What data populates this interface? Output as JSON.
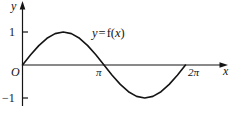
{
  "figure": {
    "background_color": "#ffffff",
    "ink_color": "#141414",
    "width": 231,
    "height": 114
  },
  "axes": {
    "x_axis_label": "x",
    "y_axis_label": "y",
    "origin_label": "O",
    "x_axis_pixel_y": 65,
    "y_axis_pixel_x": 22.5,
    "x_arrow": "arrow-right",
    "y_arrow": "arrow-up"
  },
  "ticks": {
    "y": [
      {
        "label": "1",
        "value": 1,
        "pixel_y": 32
      },
      {
        "label": "−1",
        "value": -1,
        "pixel_y": 98
      }
    ],
    "x": [
      {
        "label": "π",
        "value": 3.14159,
        "pixel_x": 104
      },
      {
        "label": "2π",
        "value": 6.28318,
        "pixel_x": 196
      }
    ]
  },
  "annotations": {
    "curve_label": {
      "y_part": "y",
      "equals": "=",
      "f_name": "f",
      "open_paren": "(",
      "x_part": "x",
      "close_paren": ")",
      "full_text": "y = f(x)"
    }
  },
  "chart_data": {
    "type": "line",
    "title": "",
    "xlabel": "x",
    "ylabel": "y",
    "xlim": [
      0,
      6.28318
    ],
    "ylim": [
      -1,
      1
    ],
    "grid": false,
    "legend": "inline-annotation",
    "series": [
      {
        "name": "y = f(x)",
        "color": "#141414",
        "line_width": 1.6,
        "description": "one full sine period, rising from the origin to a maximum of 1 near x = π/2, crossing zero at x = π, falling to a minimum of −1 near x = 3π/2, and returning to zero at x = 2π",
        "x": [
          0,
          0.3142,
          0.6283,
          0.9425,
          1.2566,
          1.5708,
          1.885,
          2.1991,
          2.5133,
          2.8274,
          3.1416,
          3.4558,
          3.7699,
          4.0841,
          4.3982,
          4.7124,
          5.0265,
          5.3407,
          5.6549,
          5.969,
          6.2832
        ],
        "y": [
          0,
          0.309,
          0.5878,
          0.809,
          0.9511,
          1,
          0.9511,
          0.809,
          0.5878,
          0.309,
          0,
          -0.309,
          -0.5878,
          -0.809,
          -0.9511,
          -1,
          -0.9511,
          -0.809,
          -0.5878,
          -0.309,
          0
        ]
      }
    ],
    "key_points": [
      {
        "name": "origin",
        "x": 0,
        "y": 0
      },
      {
        "name": "maximum",
        "x": 1.5708,
        "y": 1
      },
      {
        "name": "zero-crossing",
        "x": 3.14159,
        "y": 0
      },
      {
        "name": "minimum",
        "x": 4.7124,
        "y": -1
      },
      {
        "name": "end",
        "x": 6.28318,
        "y": 0
      }
    ]
  }
}
